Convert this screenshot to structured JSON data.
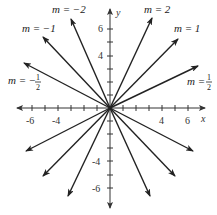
{
  "diagram": {
    "title": "",
    "axes": {
      "x_label": "x",
      "y_label": "y",
      "x_ticks": [
        "-6",
        "-4",
        "4",
        "6"
      ],
      "y_ticks": [
        "6",
        "4",
        "-4",
        "-6"
      ]
    },
    "lines": [
      {
        "slope_label": "m = −2",
        "slope": -2
      },
      {
        "slope_label": "m = −1",
        "slope": -1
      },
      {
        "slope_label": "m = −½",
        "slope": -0.5
      },
      {
        "slope_label": "m = 2",
        "slope": 2
      },
      {
        "slope_label": "m = 1",
        "slope": 1
      },
      {
        "slope_label": "m = ½",
        "slope": 0.5
      }
    ],
    "labels": {
      "m_neg2": "m = −2",
      "m_neg1": "m = −1",
      "m_neghalf_prefix": "m = −",
      "m_2": "m = 2",
      "m_1": "m = 1",
      "m_half_prefix": "m = ",
      "half_num": "1",
      "half_den": "2"
    },
    "colors": {
      "line": "#222222",
      "axis": "#333333"
    }
  }
}
